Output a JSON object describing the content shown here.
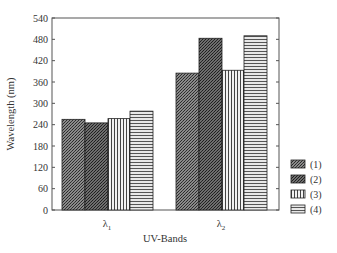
{
  "chart_data": {
    "type": "bar",
    "title": "",
    "xlabel": "UV-Bands",
    "ylabel": "Wavelength (nm)",
    "categories": [
      "λ1",
      "λ2"
    ],
    "category_labels": [
      {
        "base": "λ",
        "sub": "1"
      },
      {
        "base": "λ",
        "sub": "2"
      }
    ],
    "series": [
      {
        "name": "(1)",
        "pattern": "dense-crosshatch",
        "values": [
          255,
          385
        ]
      },
      {
        "name": "(2)",
        "pattern": "dense-crosshatch-dark",
        "values": [
          245,
          483
        ]
      },
      {
        "name": "(3)",
        "pattern": "vertical-stripes",
        "values": [
          257,
          393
        ]
      },
      {
        "name": "(4)",
        "pattern": "horizontal-stripes",
        "values": [
          278,
          490
        ]
      }
    ],
    "ylim": [
      0,
      540
    ],
    "yticks": [
      0,
      60,
      120,
      180,
      240,
      300,
      360,
      420,
      480,
      540
    ],
    "grid": false,
    "legend_position": "right-bottom"
  },
  "legend": {
    "items": [
      {
        "label": "(1)"
      },
      {
        "label": "(2)"
      },
      {
        "label": "(3)"
      },
      {
        "label": "(4)"
      }
    ]
  },
  "axes": {
    "x_label": "UV-Bands",
    "y_label": "Wavelength (nm)"
  }
}
